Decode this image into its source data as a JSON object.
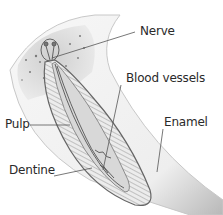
{
  "diagram": {
    "labels": {
      "nerve": "Nerve",
      "blood_vessels": "Blood vessels",
      "pulp": "Pulp",
      "enamel": "Enamel",
      "dentine": "Dentine"
    },
    "colors": {
      "line": "#555555",
      "text": "#2a2a2a",
      "gum": "#d4d4d4",
      "enamel": "#efefef",
      "dentine_fill": "#e6e6e6",
      "pulp_fill": "#cfcfcf"
    }
  }
}
